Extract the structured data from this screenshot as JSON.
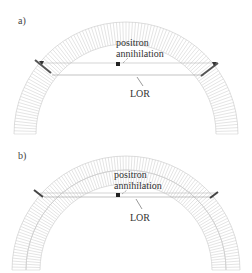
{
  "figure": {
    "panels": [
      {
        "id": "a",
        "label": "a)",
        "annotation_line1": "positron",
        "annotation_line2": "annihilation",
        "lor_label": "LOR",
        "arc_layers": 1,
        "colors": {
          "crystal_lines": "#c8c8c8",
          "detector_hit": "#555555",
          "lor": "#9a9a9a",
          "text": "#333333"
        }
      },
      {
        "id": "b",
        "label": "b)",
        "annotation_line1": "positron",
        "annotation_line2": "annihilation",
        "lor_label": "LOR",
        "arc_layers": 2,
        "colors": {
          "crystal_lines": "#c8c8c8",
          "detector_hit": "#444444",
          "lor": "#9a9a9a",
          "text": "#333333"
        }
      }
    ]
  }
}
